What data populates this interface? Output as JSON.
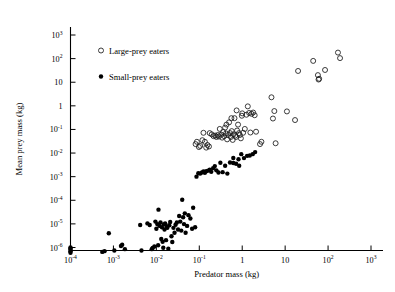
{
  "chart_data": {
    "type": "scatter",
    "title": "",
    "xlabel": "Predator mass (kg)",
    "ylabel": "Mean prey mass (kg)",
    "xscale": "log",
    "yscale": "log",
    "xlim": [
      0.0001,
      1000
    ],
    "ylim": [
      5e-07,
      3000
    ],
    "grid": false,
    "legend_position": "upper-left-inside",
    "x_ticks": [
      {
        "value": 0.0001,
        "label": "10",
        "exponent": "-4"
      },
      {
        "value": 0.001,
        "label": "10",
        "exponent": "-3"
      },
      {
        "value": 0.01,
        "label": "10",
        "exponent": "-2"
      },
      {
        "value": 0.1,
        "label": "10",
        "exponent": "-1"
      },
      {
        "value": 1,
        "label": "1",
        "exponent": ""
      },
      {
        "value": 10,
        "label": "10",
        "exponent": ""
      },
      {
        "value": 100,
        "label": "10",
        "exponent": "2"
      },
      {
        "value": 1000,
        "label": "10",
        "exponent": "3"
      }
    ],
    "y_ticks": [
      {
        "value": 1000,
        "label": "10",
        "exponent": "3"
      },
      {
        "value": 100,
        "label": "10",
        "exponent": "2"
      },
      {
        "value": 10,
        "label": "10",
        "exponent": ""
      },
      {
        "value": 1,
        "label": "1",
        "exponent": ""
      },
      {
        "value": 0.1,
        "label": "10",
        "exponent": "-1"
      },
      {
        "value": 0.01,
        "label": "10",
        "exponent": "-2"
      },
      {
        "value": 0.001,
        "label": "10",
        "exponent": "-3"
      },
      {
        "value": 0.0001,
        "label": "10",
        "exponent": "-4"
      },
      {
        "value": 1e-05,
        "label": "10",
        "exponent": "-5"
      },
      {
        "value": 1e-06,
        "label": "10",
        "exponent": "-6"
      }
    ],
    "series": [
      {
        "name": "Large-prey eaters",
        "marker": "open-circle",
        "color": "#1a1a1a",
        "points": [
          [
            0.082,
            0.024
          ],
          [
            0.088,
            0.03
          ],
          [
            0.098,
            0.018
          ],
          [
            0.105,
            0.02
          ],
          [
            0.118,
            0.035
          ],
          [
            0.125,
            0.072
          ],
          [
            0.135,
            0.03
          ],
          [
            0.145,
            0.017
          ],
          [
            0.155,
            0.022
          ],
          [
            0.168,
            0.019
          ],
          [
            0.175,
            0.07
          ],
          [
            0.195,
            0.062
          ],
          [
            0.215,
            0.052
          ],
          [
            0.235,
            0.055
          ],
          [
            0.25,
            0.048
          ],
          [
            0.27,
            0.058
          ],
          [
            0.285,
            0.05
          ],
          [
            0.3,
            0.105
          ],
          [
            0.325,
            0.06
          ],
          [
            0.34,
            0.045
          ],
          [
            0.36,
            0.078
          ],
          [
            0.38,
            0.052
          ],
          [
            0.4,
            0.12
          ],
          [
            0.42,
            0.068
          ],
          [
            0.445,
            0.038
          ],
          [
            0.47,
            0.058
          ],
          [
            0.495,
            0.2
          ],
          [
            0.52,
            0.07
          ],
          [
            0.545,
            0.048
          ],
          [
            0.57,
            0.085
          ],
          [
            0.6,
            0.036
          ],
          [
            0.63,
            0.062
          ],
          [
            0.66,
            0.3
          ],
          [
            0.69,
            0.055
          ],
          [
            0.72,
            0.048
          ],
          [
            0.76,
            0.09
          ],
          [
            0.8,
            0.16
          ],
          [
            0.84,
            0.07
          ],
          [
            0.88,
            0.058
          ],
          [
            0.93,
            0.042
          ],
          [
            0.98,
            0.38
          ],
          [
            1.0,
            0.48
          ],
          [
            1.05,
            0.072
          ],
          [
            1.15,
            0.105
          ],
          [
            1.25,
            0.42
          ],
          [
            1.35,
            0.95
          ],
          [
            1.45,
            0.5
          ],
          [
            1.55,
            0.074
          ],
          [
            1.65,
            0.46
          ],
          [
            1.8,
            0.52
          ],
          [
            1.95,
            0.4
          ],
          [
            2.1,
            0.08
          ],
          [
            0.74,
            0.64
          ],
          [
            0.56,
            0.3
          ],
          [
            0.43,
            0.16
          ],
          [
            2.6,
            0.024
          ],
          [
            2.8,
            0.03
          ],
          [
            4.8,
            2.3
          ],
          [
            5.2,
            0.29
          ],
          [
            5.6,
            0.6
          ],
          [
            6.0,
            0.026
          ],
          [
            11.0,
            0.58
          ],
          [
            17.0,
            0.25
          ],
          [
            20.0,
            30.0
          ],
          [
            45.0,
            80.0
          ],
          [
            58.0,
            20.0
          ],
          [
            60.0,
            13.0
          ],
          [
            62.0,
            14.0
          ],
          [
            85.0,
            33.0
          ],
          [
            170.0,
            180.0
          ],
          [
            190.0,
            105.0
          ]
        ]
      },
      {
        "name": "Small-prey eaters",
        "marker": "filled-circle",
        "color": "#000000",
        "points": [
          [
            0.0001,
            7e-07
          ],
          [
            0.0001,
            8e-07
          ],
          [
            0.0001,
            9e-07
          ],
          [
            0.0001,
            1e-06
          ],
          [
            0.0001,
            6e-07
          ],
          [
            0.00055,
            6.5e-07
          ],
          [
            0.00062,
            7e-07
          ],
          [
            0.00078,
            4e-06
          ],
          [
            0.00105,
            7.5e-07
          ],
          [
            0.0015,
            1.15e-06
          ],
          [
            0.0016,
            1.3e-06
          ],
          [
            0.00185,
            8.5e-07
          ],
          [
            0.0042,
            9e-06
          ],
          [
            0.0045,
            7.5e-07
          ],
          [
            0.0062,
            1.05e-05
          ],
          [
            0.007,
            9e-06
          ],
          [
            0.0078,
            8.5e-07
          ],
          [
            0.0082,
            9.5e-07
          ],
          [
            0.009,
            1.1e-06
          ],
          [
            0.0095,
            1.25e-05
          ],
          [
            0.01,
            6.2e-06
          ],
          [
            0.0105,
            9.8e-06
          ],
          [
            0.011,
            1.25e-06
          ],
          [
            0.0112,
            4e-05
          ],
          [
            0.0118,
            8.2e-06
          ],
          [
            0.0125,
            1.15e-05
          ],
          [
            0.013,
            2.3e-06
          ],
          [
            0.0135,
            7.2e-06
          ],
          [
            0.014,
            1.75e-06
          ],
          [
            0.0145,
            9.8e-07
          ],
          [
            0.015,
            9.5e-06
          ],
          [
            0.0155,
            5.8e-06
          ],
          [
            0.016,
            1.05e-05
          ],
          [
            0.0168,
            2.05e-06
          ],
          [
            0.0175,
            7.8e-06
          ],
          [
            0.018,
            6.8e-06
          ],
          [
            0.019,
            8.8e-07
          ],
          [
            0.02,
            8.8e-06
          ],
          [
            0.021,
            1.2e-05
          ],
          [
            0.0225,
            3e-06
          ],
          [
            0.0235,
            1.7e-06
          ],
          [
            0.025,
            6.8e-06
          ],
          [
            0.0265,
            4.2e-06
          ],
          [
            0.028,
            9.2e-06
          ],
          [
            0.03,
            1.15e-05
          ],
          [
            0.032,
            5.8e-06
          ],
          [
            0.034,
            2.15e-05
          ],
          [
            0.036,
            1.25e-05
          ],
          [
            0.038,
            5.2e-06
          ],
          [
            0.04,
            0.000105
          ],
          [
            0.042,
            1.9e-05
          ],
          [
            0.044,
            9.8e-06
          ],
          [
            0.046,
            2.8e-05
          ],
          [
            0.048,
            4.2e-06
          ],
          [
            0.052,
            8.2e-06
          ],
          [
            0.056,
            2.35e-05
          ],
          [
            0.062,
            1.7e-05
          ],
          [
            0.068,
            6.2e-06
          ],
          [
            0.072,
            4.8e-05
          ],
          [
            0.08,
            7.2e-06
          ],
          [
            0.086,
            0.001
          ],
          [
            0.095,
            0.0014
          ],
          [
            0.105,
            0.00135
          ],
          [
            0.115,
            0.0015
          ],
          [
            0.125,
            0.00165
          ],
          [
            0.135,
            0.00145
          ],
          [
            0.145,
            0.0017
          ],
          [
            0.16,
            0.0018
          ],
          [
            0.175,
            0.00195
          ],
          [
            0.19,
            0.0016
          ],
          [
            0.21,
            0.0023
          ],
          [
            0.23,
            0.0028
          ],
          [
            0.25,
            0.00185
          ],
          [
            0.28,
            0.0015
          ],
          [
            0.31,
            0.0039
          ],
          [
            0.35,
            0.00155
          ],
          [
            0.4,
            0.0029
          ],
          [
            0.45,
            0.00135
          ],
          [
            0.52,
            0.004
          ],
          [
            0.62,
            0.0038
          ],
          [
            0.72,
            0.0035
          ],
          [
            0.85,
            0.0029
          ],
          [
            0.95,
            0.009
          ],
          [
            1.1,
            0.0061
          ],
          [
            1.3,
            0.0076
          ],
          [
            1.5,
            0.0079
          ],
          [
            1.75,
            0.009
          ],
          [
            2.0,
            0.011
          ],
          [
            0.62,
            0.0062
          ],
          [
            0.82,
            0.0055
          ]
        ]
      }
    ]
  },
  "legend": {
    "entries": [
      {
        "label": "Large-prey eaters",
        "marker": "open-circle"
      },
      {
        "label": "Small-prey eaters",
        "marker": "filled-circle"
      }
    ]
  }
}
